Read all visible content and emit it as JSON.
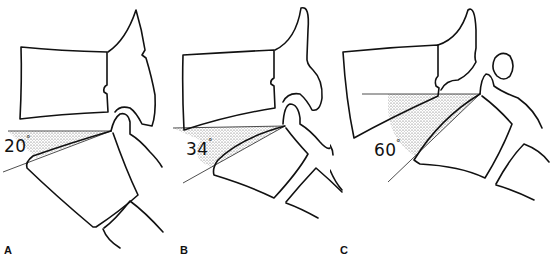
{
  "figure": {
    "type": "anatomical-line-diagram",
    "panels": [
      {
        "label": "A",
        "angle_value": "20",
        "angle_unit": "°"
      },
      {
        "label": "B",
        "angle_value": "34",
        "angle_unit": "°"
      },
      {
        "label": "C",
        "angle_value": "60",
        "angle_unit": "°"
      }
    ],
    "colors": {
      "line": "#111111",
      "stipple": "#555555",
      "background": "#ffffff"
    }
  }
}
